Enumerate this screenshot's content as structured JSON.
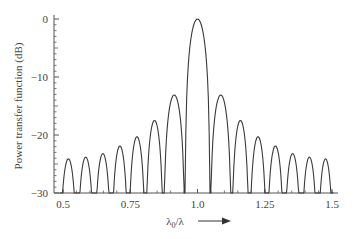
{
  "chart_data": {
    "type": "line",
    "title": "",
    "xlabel": "λ0/λ",
    "xlabel_main": "λ",
    "xlabel_sub": "0",
    "xlabel_tail": "/λ",
    "ylabel": "Power transfer function (dB)",
    "xlim": [
      0.5,
      1.5
    ],
    "ylim": [
      -30,
      0
    ],
    "x_ticks": [
      "0.5",
      "0.75",
      "1.0",
      "1.25",
      "1.5"
    ],
    "x_tick_values": [
      0.5,
      0.75,
      1.0,
      1.25,
      1.5
    ],
    "y_ticks": [
      "0",
      "−10",
      "−20",
      "−30"
    ],
    "y_tick_values": [
      0,
      -10,
      -20,
      -30
    ],
    "grid": false,
    "legend": null,
    "annotations": [
      "arrow pointing right next to x-axis label"
    ],
    "series": [
      {
        "name": "Power transfer function",
        "description": "sinc²-like spectral response with main lobe at 1.0 and symmetric sidelobes",
        "peaks": {
          "x": [
            0.52,
            0.585,
            0.648,
            0.712,
            0.774,
            0.84,
            0.907,
            1.0,
            1.093,
            1.16,
            1.225,
            1.29,
            1.354,
            1.417,
            1.476
          ],
          "y": [
            -24.1,
            -23.8,
            -23.2,
            -21.9,
            -20.3,
            -17.5,
            -13.1,
            0,
            -13.1,
            -17.5,
            -20.3,
            -21.9,
            -23.2,
            -23.8,
            -24.1
          ]
        }
      }
    ]
  },
  "colors": {
    "line": "#3a3a3a",
    "axis": "#555555",
    "background": "#ffffff"
  }
}
